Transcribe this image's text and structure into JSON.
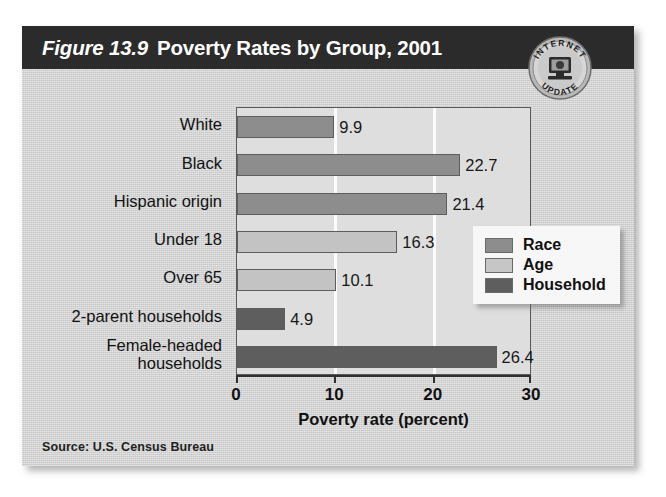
{
  "card": {
    "figure_number": "Figure 13.9",
    "title": "Poverty Rates by Group, 2001",
    "source": "Source: U.S. Census Bureau"
  },
  "badge": {
    "top_text": "INTERNET",
    "bottom_text": "UPDATE",
    "icon": "computer-monitor-icon"
  },
  "legend": {
    "position": "inside-right",
    "items": [
      {
        "label": "Race",
        "color": "#8d8d8d",
        "key": "race"
      },
      {
        "label": "Age",
        "color": "#c6c6c6",
        "key": "age"
      },
      {
        "label": "Household",
        "color": "#5e5e5e",
        "key": "household"
      }
    ]
  },
  "chart_data": {
    "type": "bar",
    "orientation": "horizontal",
    "title": "Poverty Rates by Group, 2001",
    "subtitle": "",
    "xlabel": "Poverty rate (percent)",
    "ylabel": "",
    "xlim": [
      0,
      30
    ],
    "xticks": [
      0,
      10,
      20,
      30
    ],
    "xticklabels": [
      "0",
      "10",
      "20",
      "30"
    ],
    "grid": "vertical-white-gridlines-at-10-and-20",
    "legend_position": "inside-right",
    "categories": [
      "White",
      "Black",
      "Hispanic origin",
      "Under 18",
      "Over 65",
      "2-parent households",
      "Female-headed\nhouseholds"
    ],
    "values": [
      9.9,
      22.7,
      21.4,
      16.3,
      10.1,
      4.9,
      26.4
    ],
    "value_labels": [
      "9.9",
      "22.7",
      "21.4",
      "16.3",
      "10.1",
      "4.9",
      "26.4"
    ],
    "groups": [
      "race",
      "race",
      "race",
      "age",
      "age",
      "household",
      "household"
    ],
    "series": [
      {
        "name": "Poverty rate (percent)",
        "values": [
          9.9,
          22.7,
          21.4,
          16.3,
          10.1,
          4.9,
          26.4
        ]
      }
    ]
  }
}
